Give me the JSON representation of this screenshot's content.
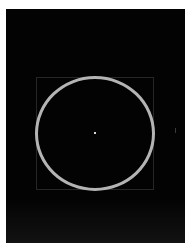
{
  "canvas": {
    "background": "#ffffff",
    "frame_color": "#030303"
  },
  "shapes": {
    "circle": {
      "stroke_color": "#b4b4b4",
      "stroke_width": 3,
      "center": [
        95,
        133
      ],
      "size": [
        120,
        115
      ]
    },
    "square": {
      "stroke_color": "#262626",
      "bounds": [
        36,
        77,
        154,
        190
      ]
    },
    "center_dot": {
      "color": "#d8d8d8",
      "position": [
        95,
        133
      ]
    }
  }
}
